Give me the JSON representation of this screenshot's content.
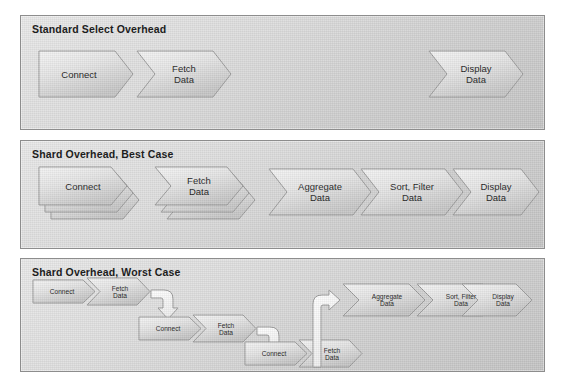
{
  "diagram": {
    "title_hidden": "",
    "panels": [
      {
        "id": "standard-select-overhead",
        "title": "Standard Select Overhead",
        "steps": [
          {
            "label": [
              "Connect"
            ],
            "shape": "arrow",
            "stacked": false
          },
          {
            "label": [
              "Fetch",
              "Data"
            ],
            "shape": "chevron",
            "stacked": false
          },
          {
            "label": [
              "Display",
              "Data"
            ],
            "shape": "chevron",
            "stacked": false
          }
        ]
      },
      {
        "id": "shard-overhead-best-case",
        "title": "Shard Overhead, Best Case",
        "steps": [
          {
            "label": [
              "Connect"
            ],
            "shape": "arrow",
            "stacked": true
          },
          {
            "label": [
              "Fetch",
              "Data"
            ],
            "shape": "chevron",
            "stacked": true
          },
          {
            "label": [
              "Aggregate",
              "Data"
            ],
            "shape": "chevron",
            "stacked": false
          },
          {
            "label": [
              "Sort, Filter",
              "Data"
            ],
            "shape": "chevron",
            "stacked": false
          },
          {
            "label": [
              "Display",
              "Data"
            ],
            "shape": "chevron",
            "stacked": false
          }
        ]
      },
      {
        "id": "shard-overhead-worst-case",
        "title": "Shard Overhead, Worst Case",
        "rows": [
          {
            "steps": [
              {
                "label": [
                  "Connect"
                ],
                "shape": "arrow"
              },
              {
                "label": [
                  "Fetch",
                  "Data"
                ],
                "shape": "chevron"
              }
            ]
          },
          {
            "steps": [
              {
                "label": [
                  "Connect"
                ],
                "shape": "arrow"
              },
              {
                "label": [
                  "Fetch",
                  "Data"
                ],
                "shape": "chevron"
              }
            ]
          },
          {
            "steps": [
              {
                "label": [
                  "Connect"
                ],
                "shape": "arrow"
              },
              {
                "label": [
                  "Fetch",
                  "Data"
                ],
                "shape": "chevron"
              }
            ]
          }
        ],
        "tail_steps": [
          {
            "label": [
              "Aggregate",
              "Data"
            ],
            "shape": "chevron"
          },
          {
            "label": [
              "Sort, Filter",
              "Data"
            ],
            "shape": "chevron"
          },
          {
            "label": [
              "Display",
              "Data"
            ],
            "shape": "chevron"
          }
        ],
        "connectors": [
          "fetch1-to-connect2",
          "fetch2-to-connect3",
          "fetch3-to-aggregate"
        ]
      }
    ],
    "colors": {
      "panel_border": "#8d8d8d",
      "panel_fill": "#dcdcdc",
      "shape_fill": "#e4e4e4",
      "shape_border": "#9a9a9a",
      "text": "#232323",
      "connector_fill": "#ffffff",
      "connector_border": "#9a9a9a"
    }
  }
}
